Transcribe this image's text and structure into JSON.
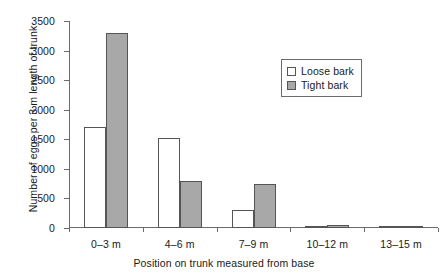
{
  "chart_data": {
    "type": "bar",
    "title": "",
    "xlabel": "Position on trunk measured from base",
    "ylabel": "Number of eggs per 3 m length of trunk",
    "categories": [
      "0–3 m",
      "4–6 m",
      "7–9 m",
      "10–12 m",
      "13–15 m"
    ],
    "series": [
      {
        "name": "Loose bark",
        "values": [
          1700,
          1530,
          310,
          30,
          20
        ],
        "color": "#ffffff"
      },
      {
        "name": "Tight bark",
        "values": [
          3300,
          790,
          740,
          50,
          30
        ],
        "color": "#a8a8a8"
      }
    ],
    "ylim": [
      0,
      3500
    ],
    "yticks": [
      0,
      500,
      1000,
      1500,
      2000,
      2500,
      3000,
      3500
    ],
    "ytick_labels": [
      "0",
      "500",
      "1000",
      "1500",
      "2000",
      "2500",
      "3000",
      "3500"
    ],
    "grid": false,
    "legend_position": "upper-center-right",
    "legend": [
      "Loose bark",
      "Tight bark"
    ],
    "axis_color": "#6b6b6b",
    "bar_edge_color": "#555555"
  }
}
